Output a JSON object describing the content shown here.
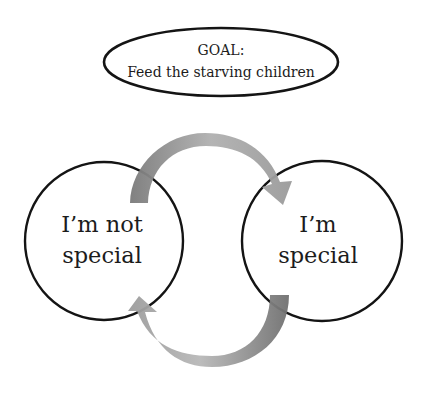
{
  "goal": {
    "line1": "GOAL:",
    "line2": "Feed the starving children"
  },
  "nodes": [
    {
      "line1": "I’m not",
      "line2": "special"
    },
    {
      "line1": "I’m",
      "line2": "special"
    }
  ],
  "arrows": [
    {
      "from": "I’m not special",
      "to": "I’m special",
      "direction": "clockwise-top"
    },
    {
      "from": "I’m special",
      "to": "I’m not special",
      "direction": "clockwise-bottom"
    }
  ],
  "colors": {
    "stroke": "#141414",
    "arrow_light": "#cfcfcf",
    "arrow_dark": "#7d7d7d",
    "background": "#ffffff"
  }
}
